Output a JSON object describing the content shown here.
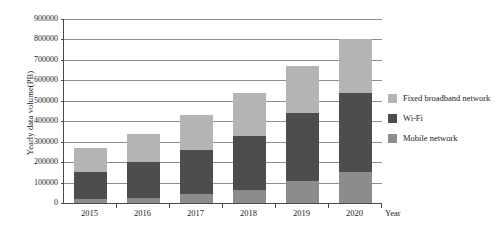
{
  "chart_data": {
    "type": "bar",
    "subtype": "stacked-bar",
    "title": "",
    "xlabel": "Year",
    "ylabel": "Yearly data volume(PB)",
    "categories": [
      "2015",
      "2016",
      "2017",
      "2018",
      "2019",
      "2020"
    ],
    "ylim": [
      0,
      900000
    ],
    "ytick_step": 100000,
    "yticks": [
      "900000",
      "800000",
      "700000",
      "600000",
      "500000",
      "400000",
      "300000",
      "200000",
      "100000",
      "0"
    ],
    "grid": true,
    "legend_position": "right",
    "series": [
      {
        "name": "Fixed broadband network",
        "color": "#b4b4b4",
        "values": [
          120000,
          140000,
          170000,
          210000,
          230000,
          260000
        ]
      },
      {
        "name": "Wi-Fi",
        "color": "#4d4d4d",
        "values": [
          130000,
          175000,
          215000,
          265000,
          330000,
          390000
        ]
      },
      {
        "name": "Mobile network",
        "color": "#8c8c8c",
        "values": [
          20000,
          25000,
          45000,
          65000,
          110000,
          150000
        ]
      }
    ],
    "totals": [
      270000,
      340000,
      430000,
      540000,
      670000,
      800000
    ],
    "stack_order_bottom_to_top": [
      "Mobile network",
      "Wi-Fi",
      "Fixed broadband network"
    ],
    "colors": {
      "fixed_broadband_network": "#b4b4b4",
      "wifi": "#4d4d4d",
      "mobile_network": "#8c8c8c",
      "axis": "#4a4a4a",
      "gridline": "#8c8c8c",
      "background": "#ffffff"
    }
  },
  "legend": {
    "items": [
      {
        "label": "Fixed broadband network",
        "color": "#b4b4b4"
      },
      {
        "label": "Wi-Fi",
        "color": "#4d4d4d"
      },
      {
        "label": "Mobile network",
        "color": "#8c8c8c"
      }
    ]
  }
}
